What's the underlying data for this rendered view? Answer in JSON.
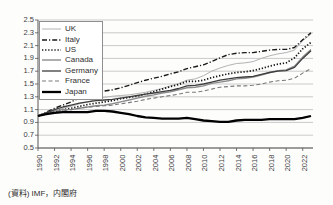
{
  "source_note": "(資料) IMF，内閣府",
  "chart_data": {
    "type": "line",
    "title": "",
    "xlabel": "",
    "ylabel": "",
    "x_start": 1990,
    "x_end": 2023,
    "ylim": [
      0.5,
      2.5
    ],
    "grid": true,
    "legend_position": "top-left",
    "y_ticks": [
      "0.5",
      "0.7",
      "0.9",
      "1.1",
      "1.3",
      "1.5",
      "1.7",
      "1.9",
      "2.1",
      "2.3",
      "2.5"
    ],
    "x_tick_years": [
      1990,
      1992,
      1994,
      1996,
      1998,
      2000,
      2002,
      2004,
      2006,
      2008,
      2010,
      2012,
      2014,
      2016,
      2018,
      2020,
      2022
    ],
    "axis_color": "#555555",
    "grid_color": "#b4b4b4",
    "series": [
      {
        "name": "UK",
        "color": "#b3b3b3",
        "width": 1.0,
        "dash": "",
        "values": [
          1.0,
          1.06,
          1.1,
          1.12,
          1.15,
          1.19,
          1.22,
          1.26,
          1.29,
          1.31,
          1.32,
          1.33,
          1.35,
          1.37,
          1.4,
          1.43,
          1.47,
          1.51,
          1.56,
          1.58,
          1.63,
          1.7,
          1.75,
          1.79,
          1.82,
          1.83,
          1.85,
          1.9,
          1.94,
          1.97,
          1.99,
          2.03,
          2.18,
          2.28
        ]
      },
      {
        "name": "Italy",
        "color": "#1a1a1a",
        "width": 1.4,
        "dash": "5,2,1.2,2",
        "values": [
          1.0,
          1.06,
          1.12,
          1.17,
          1.22,
          1.28,
          1.33,
          1.36,
          1.39,
          1.41,
          1.44,
          1.48,
          1.52,
          1.56,
          1.59,
          1.62,
          1.66,
          1.69,
          1.74,
          1.77,
          1.8,
          1.85,
          1.91,
          1.96,
          1.98,
          1.99,
          1.99,
          2.01,
          2.03,
          2.04,
          2.04,
          2.07,
          2.19,
          2.3
        ]
      },
      {
        "name": "US",
        "color": "#141414",
        "width": 1.7,
        "dash": "1.3,1.8",
        "values": [
          1.0,
          1.04,
          1.07,
          1.1,
          1.12,
          1.15,
          1.18,
          1.2,
          1.22,
          1.24,
          1.27,
          1.29,
          1.31,
          1.34,
          1.38,
          1.42,
          1.46,
          1.49,
          1.54,
          1.54,
          1.56,
          1.6,
          1.63,
          1.66,
          1.68,
          1.69,
          1.71,
          1.74,
          1.78,
          1.81,
          1.83,
          1.91,
          2.05,
          2.15
        ]
      },
      {
        "name": "Canada",
        "color": "#8c8c8c",
        "width": 1.4,
        "dash": "",
        "values": [
          1.0,
          1.05,
          1.08,
          1.1,
          1.1,
          1.12,
          1.14,
          1.16,
          1.17,
          1.19,
          1.22,
          1.25,
          1.28,
          1.31,
          1.33,
          1.36,
          1.38,
          1.41,
          1.44,
          1.45,
          1.47,
          1.51,
          1.53,
          1.55,
          1.58,
          1.59,
          1.61,
          1.64,
          1.68,
          1.71,
          1.72,
          1.78,
          1.92,
          2.04
        ]
      },
      {
        "name": "Germany",
        "color": "#3d3d3d",
        "width": 1.3,
        "dash": "",
        "values": [
          1.0,
          1.05,
          1.1,
          1.14,
          1.17,
          1.2,
          1.22,
          1.24,
          1.25,
          1.26,
          1.28,
          1.3,
          1.32,
          1.34,
          1.36,
          1.38,
          1.4,
          1.43,
          1.47,
          1.48,
          1.5,
          1.53,
          1.56,
          1.58,
          1.6,
          1.61,
          1.62,
          1.65,
          1.68,
          1.7,
          1.71,
          1.76,
          1.9,
          2.02
        ]
      },
      {
        "name": "France",
        "color": "#7a7a7a",
        "width": 1.1,
        "dash": "4,2.5",
        "values": [
          1.0,
          1.03,
          1.06,
          1.08,
          1.1,
          1.12,
          1.14,
          1.15,
          1.16,
          1.17,
          1.19,
          1.21,
          1.23,
          1.26,
          1.28,
          1.3,
          1.32,
          1.34,
          1.37,
          1.37,
          1.39,
          1.42,
          1.45,
          1.46,
          1.47,
          1.47,
          1.48,
          1.5,
          1.53,
          1.55,
          1.56,
          1.59,
          1.67,
          1.74
        ]
      },
      {
        "name": "Japan",
        "color": "#000000",
        "width": 2.3,
        "dash": "",
        "values": [
          1.0,
          1.03,
          1.05,
          1.06,
          1.06,
          1.06,
          1.06,
          1.08,
          1.08,
          1.07,
          1.05,
          1.03,
          1.0,
          0.98,
          0.97,
          0.96,
          0.96,
          0.96,
          0.97,
          0.95,
          0.93,
          0.92,
          0.91,
          0.91,
          0.93,
          0.94,
          0.94,
          0.94,
          0.95,
          0.95,
          0.95,
          0.95,
          0.97,
          1.0
        ]
      }
    ]
  }
}
